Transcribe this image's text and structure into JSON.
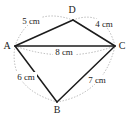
{
  "figure": {
    "type": "geometry-quadrilateral",
    "vertices": {
      "a": "A",
      "b": "B",
      "c": "C",
      "d": "D"
    },
    "measurements": {
      "side_ad": "5 cm",
      "side_dc": "4 cm",
      "diagonal_ac": "8 cm",
      "side_ab": "6 cm",
      "side_bc": "7 cm"
    },
    "geometry": {
      "edges": [
        {
          "from": "A",
          "to": "D",
          "length": "5 cm",
          "style": "solid"
        },
        {
          "from": "D",
          "to": "C",
          "length": "4 cm",
          "style": "solid"
        },
        {
          "from": "A",
          "to": "C",
          "length": "8 cm",
          "style": "solid"
        },
        {
          "from": "A",
          "to": "B",
          "length": "6 cm",
          "style": "solid"
        },
        {
          "from": "B",
          "to": "C",
          "length": "7 cm",
          "style": "solid"
        }
      ],
      "measurement_arcs": "dotted gray arcs bowing outward from each measured segment"
    },
    "colors": {
      "background": "#ffffff",
      "edge_line": "#1c1c1c",
      "dotted_arc": "#a3a3a3",
      "text": "#1c1c1c"
    }
  }
}
